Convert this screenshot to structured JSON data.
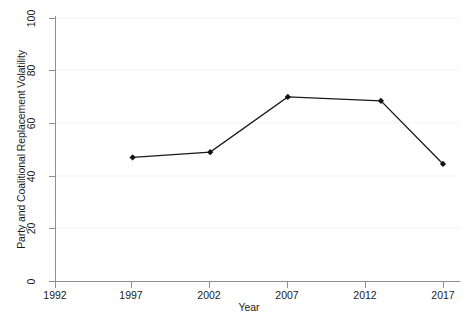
{
  "chart_data": {
    "type": "line",
    "title": "",
    "xlabel": "Year",
    "ylabel": "Party and Coalitional Replacement Volatility",
    "x": [
      1997,
      2002,
      2007,
      2013,
      2017
    ],
    "values": [
      47,
      49,
      70,
      68.5,
      44.5
    ],
    "series": [
      {
        "name": "Party and Coalitional Replacement Volatility",
        "x": [
          1997,
          2002,
          2007,
          2013,
          2017
        ],
        "values": [
          47,
          49,
          70,
          68.5,
          44.5
        ]
      }
    ],
    "xlim": [
      1992,
      2017
    ],
    "ylim": [
      0,
      100
    ],
    "x_ticks": [
      1992,
      1997,
      2002,
      2007,
      2012,
      2017
    ],
    "x_tick_labels": [
      "1992",
      "1997",
      "2002",
      "2007",
      "2012",
      "2017"
    ],
    "y_ticks": [
      0,
      20,
      40,
      60,
      80,
      100
    ],
    "y_tick_labels": [
      "0",
      "20",
      "40",
      "60",
      "80",
      "100"
    ],
    "grid": true,
    "grid_axis": "y",
    "legend": "none",
    "marker": "filled-diamond",
    "line_color": "#1a1a1a",
    "marker_color": "#111111",
    "grid_color": "#f2f2f2",
    "axis_color": "#8c8c8c",
    "background_color": "#ffffff"
  },
  "axes": {
    "x_title": "Year",
    "y_title": "Party and Coalitional Replacement Volatility"
  }
}
